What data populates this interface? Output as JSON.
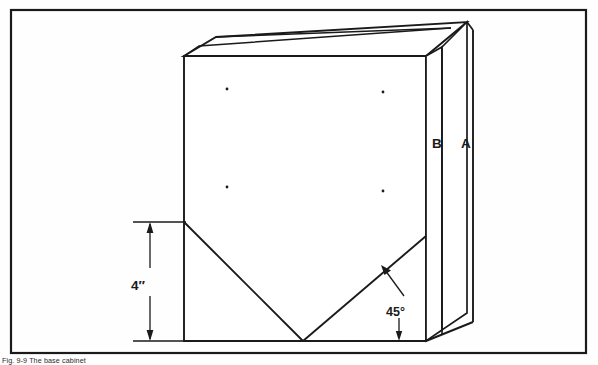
{
  "figure": {
    "kind": "technical-line-drawing",
    "background_color": "#fefefe",
    "line_color": "#1a1a1a",
    "caption": "Fig. 9-9 The base cabinet",
    "border": {
      "x": 11,
      "y": 10,
      "width": 575,
      "height": 343,
      "stroke": 2.2
    },
    "labels": {
      "panel_b": "B",
      "panel_a": "A",
      "angle": "45°",
      "height": "4″"
    },
    "label_positions": {
      "panel_b": {
        "x": 432,
        "y": 143
      },
      "panel_a": {
        "x": 462,
        "y": 143
      },
      "angle": {
        "x": 399,
        "y": 311
      },
      "height": {
        "x": 139,
        "y": 287
      }
    },
    "geometry": {
      "front_face": {
        "left": 184,
        "right": 426,
        "top": 56,
        "bottom": 341
      },
      "top_back_left": {
        "x": 216,
        "y": 37
      },
      "top_back_right": {
        "x": 467,
        "y": 22
      },
      "notch_apex": {
        "x": 303,
        "y": 341
      },
      "notch_left_start": {
        "x": 184,
        "y": 222
      },
      "notch_right_end": {
        "x": 426,
        "y": 236
      },
      "panel_edges_x": [
        426,
        442,
        473
      ],
      "panel_bottom_slant": {
        "from_x": 426,
        "from_y": 341,
        "to_x": 473,
        "to_y": 322
      },
      "dots": [
        {
          "x": 227,
          "y": 89
        },
        {
          "x": 383,
          "y": 92
        },
        {
          "x": 227,
          "y": 187
        },
        {
          "x": 383,
          "y": 191
        }
      ],
      "dimension_4in": {
        "line_x": 150,
        "top_y": 222,
        "bottom_y": 341,
        "ext_left_x": 133,
        "ext_right_x": 186
      },
      "angle_leader": {
        "tip_x": 383,
        "tip_y": 268,
        "elbow_x": 404,
        "elbow_y": 296
      }
    }
  }
}
